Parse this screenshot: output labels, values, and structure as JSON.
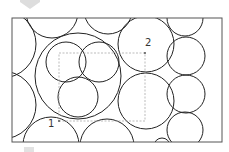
{
  "diagram": {
    "type": "circle-packing",
    "frame": {
      "x": 12,
      "y": 18,
      "width": 210,
      "height": 124,
      "stroke": "#555555"
    },
    "circle_stroke": "#222222",
    "circles": [
      {
        "id": "big-left",
        "cx": 78,
        "cy": 76,
        "r": 43
      },
      {
        "id": "inner-top-left",
        "cx": 66,
        "cy": 62,
        "r": 20
      },
      {
        "id": "inner-top-right",
        "cx": 99,
        "cy": 62,
        "r": 20
      },
      {
        "id": "inner-bottom",
        "cx": 78,
        "cy": 97,
        "r": 20
      },
      {
        "id": "right-top-large",
        "cx": 146,
        "cy": 44,
        "r": 28
      },
      {
        "id": "right-bottom-large",
        "cx": 146,
        "cy": 101,
        "r": 28
      },
      {
        "id": "col-1",
        "cx": 186,
        "cy": 56,
        "r": 19
      },
      {
        "id": "col-2",
        "cx": 186,
        "cy": 94,
        "r": 19
      },
      {
        "id": "col-3",
        "cx": 185,
        "cy": 130,
        "r": 18
      },
      {
        "id": "top-right-arc",
        "cx": 185,
        "cy": 18,
        "r": 18
      },
      {
        "id": "top-arc-1",
        "cx": 52,
        "cy": 12,
        "r": 26
      },
      {
        "id": "top-arc-2",
        "cx": 108,
        "cy": 10,
        "r": 24
      },
      {
        "id": "left-arc-1",
        "cx": 2,
        "cy": 44,
        "r": 34
      },
      {
        "id": "left-arc-2",
        "cx": 2,
        "cy": 105,
        "r": 34
      },
      {
        "id": "bottom-arc-1",
        "cx": 51,
        "cy": 145,
        "r": 28
      },
      {
        "id": "bottom-arc-2",
        "cx": 107,
        "cy": 146,
        "r": 27
      },
      {
        "id": "bottom-tiny-arc",
        "cx": 162,
        "cy": 146,
        "r": 8
      }
    ],
    "selection_rect": {
      "x": 59,
      "y": 53,
      "width": 86,
      "height": 68,
      "stroke": "#aaaaaa"
    },
    "points": [
      {
        "label": "1",
        "x": 59,
        "y": 121,
        "label_x": 48,
        "label_y": 127
      },
      {
        "label": "2",
        "x": 145,
        "y": 53,
        "label_x": 145,
        "label_y": 46
      }
    ],
    "decor": {
      "top_marker_color": "#dddddd",
      "bottom_marker_color": "#e2e2e2"
    }
  }
}
